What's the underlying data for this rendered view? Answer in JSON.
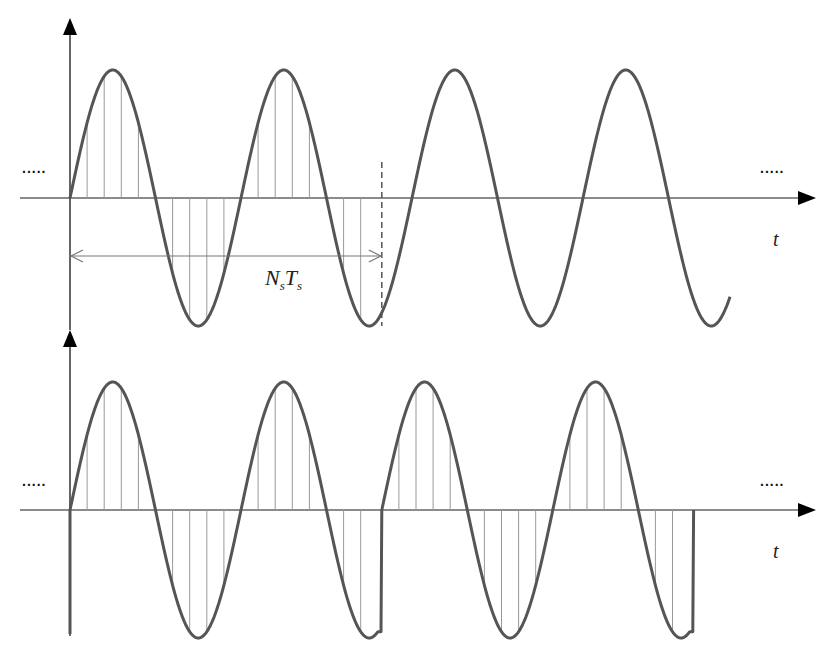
{
  "figure": {
    "colors": {
      "curve": "#555555",
      "axis": "#666666",
      "sample": "#999999",
      "arrow": "#000000"
    },
    "top_panel": {
      "axis_label": "t",
      "ellipsis_left": ".....",
      "ellipsis_right": ".....",
      "window_label_main": "N",
      "window_label_sub1": "s",
      "window_label_main2": "T",
      "window_label_sub2": "s",
      "window_label": "N_s T_s"
    },
    "bottom_panel": {
      "axis_label": "t",
      "ellipsis_left": ".....",
      "ellipsis_right": "....."
    }
  },
  "chart_data": [
    {
      "type": "line",
      "title": "Continuous sinusoid with sampled window",
      "xlabel": "t",
      "ylabel": "",
      "series": [
        {
          "name": "sin signal",
          "function": "sin(2*pi*t/T0)",
          "periods_shown": 3.8,
          "amplitude": 1
        }
      ],
      "samples_per_period": 10,
      "window": {
        "label": "N_s T_s",
        "periods": 1.8
      },
      "grid": false
    },
    {
      "type": "line",
      "title": "Periodic extension of windowed samples",
      "xlabel": "t",
      "ylabel": "",
      "series": [
        {
          "name": "periodically extended window",
          "repeats": 2,
          "periods_per_repeat": 1.8,
          "discontinuity_at_boundary": true
        }
      ],
      "samples_per_period": 10,
      "grid": false
    }
  ]
}
